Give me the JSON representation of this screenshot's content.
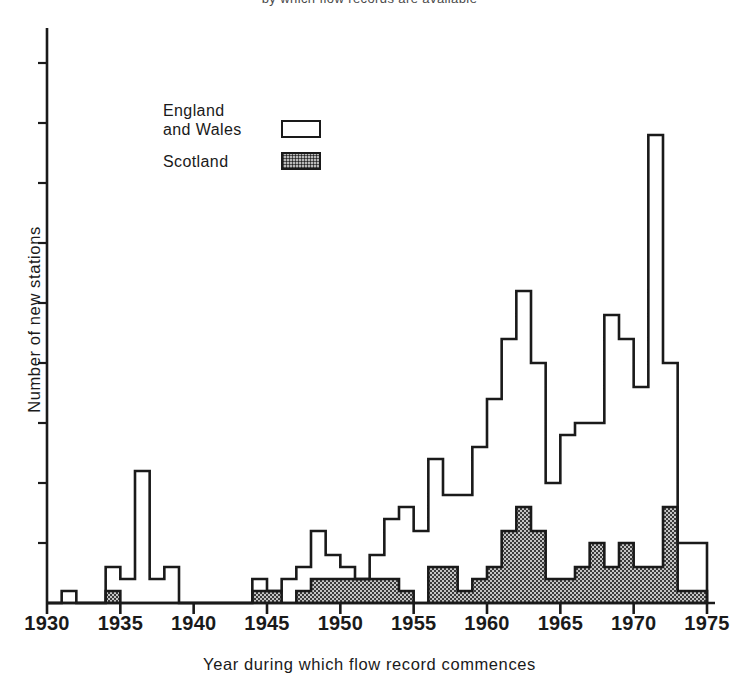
{
  "caption": {
    "top_partial": "by which flow records are available"
  },
  "axes": {
    "x_label": "Year during which flow record commences",
    "y_label": "Number of new stations",
    "x_ticks": [
      1930,
      1935,
      1940,
      1945,
      1950,
      1955,
      1960,
      1965,
      1970,
      1975
    ]
  },
  "legend": {
    "items": [
      {
        "label_line1": "England",
        "label_line2": "and Wales",
        "swatch": "open"
      },
      {
        "label_line1": "Scotland",
        "label_line2": "",
        "swatch": "hatch"
      }
    ]
  },
  "colors": {
    "ink": "#1a1a1a",
    "paper": "#ffffff",
    "scotland_fill": "#b9b9b9"
  },
  "chart_data": {
    "type": "bar",
    "title": "",
    "subtitle": "",
    "xlabel": "Year during which flow record commences",
    "ylabel": "Number of new stations",
    "xlim": [
      1930,
      1975
    ],
    "ylim": [
      0,
      47
    ],
    "grid": false,
    "legend_position": "upper-left",
    "stacked": true,
    "note": "Stacked histogram of new gauging stations by start year. 'Scotland' is the lower stippled band; 'England and Wales' is the open band stacked above it. Values read off 5-unit axis ticks (60 px per 5 stations, baseline y=603).",
    "categories": [
      1930,
      1931,
      1932,
      1933,
      1934,
      1935,
      1936,
      1937,
      1938,
      1939,
      1940,
      1941,
      1942,
      1943,
      1944,
      1945,
      1946,
      1947,
      1948,
      1949,
      1950,
      1951,
      1952,
      1953,
      1954,
      1955,
      1956,
      1957,
      1958,
      1959,
      1960,
      1961,
      1962,
      1963,
      1964,
      1965,
      1966,
      1967,
      1968,
      1969,
      1970,
      1971,
      1972,
      1973,
      1974
    ],
    "series": [
      {
        "name": "Scotland",
        "values": [
          0,
          0,
          0,
          0,
          1,
          0,
          0,
          0,
          0,
          0,
          0,
          0,
          0,
          0,
          1,
          1,
          0,
          1,
          2,
          2,
          2,
          2,
          2,
          2,
          1,
          0,
          3,
          3,
          1,
          2,
          3,
          6,
          8,
          6,
          2,
          2,
          3,
          5,
          3,
          5,
          3,
          3,
          8,
          1,
          1
        ]
      },
      {
        "name": "England and Wales",
        "values": [
          0,
          1,
          0,
          0,
          2,
          2,
          11,
          2,
          3,
          0,
          0,
          0,
          0,
          0,
          1,
          0,
          2,
          2,
          4,
          2,
          1,
          0,
          2,
          5,
          7,
          6,
          9,
          6,
          8,
          11,
          14,
          16,
          18,
          14,
          8,
          12,
          12,
          10,
          21,
          17,
          15,
          36,
          12,
          4,
          4
        ]
      }
    ],
    "totals": [
      0,
      1,
      0,
      0,
      3,
      2,
      11,
      2,
      3,
      0,
      0,
      0,
      0,
      0,
      2,
      1,
      2,
      3,
      6,
      4,
      3,
      2,
      4,
      7,
      8,
      6,
      12,
      9,
      9,
      13,
      17,
      22,
      26,
      20,
      10,
      14,
      15,
      15,
      24,
      22,
      18,
      39,
      20,
      5,
      5
    ],
    "y_tick_interval": 5,
    "y_tick_labels_shown": false
  }
}
